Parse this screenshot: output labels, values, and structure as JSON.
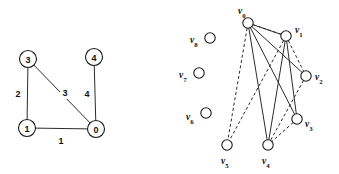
{
  "figure": {
    "width": 339,
    "height": 174,
    "background": "#ffffff",
    "stroke_color": "#2b2b2b",
    "node_fill": "#ffffff"
  },
  "left_graph": {
    "name": "weighted-undirected-graph",
    "nodes": [
      {
        "id": "3",
        "label": "3",
        "cx": 28,
        "cy": 59,
        "r": 8.5
      },
      {
        "id": "4",
        "label": "4",
        "cx": 94,
        "cy": 57,
        "r": 8.5
      },
      {
        "id": "1",
        "label": "1",
        "cx": 27,
        "cy": 128,
        "r": 8.5
      },
      {
        "id": "0",
        "label": "0",
        "cx": 96,
        "cy": 129,
        "r": 8.5
      }
    ],
    "edges": [
      {
        "from": "3",
        "to": "1",
        "weight": "2",
        "style": "solid",
        "label_x": 18,
        "label_y": 94
      },
      {
        "from": "3",
        "to": "0",
        "weight": "3",
        "style": "solid",
        "label_x": 65,
        "label_y": 93
      },
      {
        "from": "1",
        "to": "0",
        "weight": "1",
        "style": "solid",
        "label_x": 61,
        "label_y": 141
      },
      {
        "from": "4",
        "to": "0",
        "weight": "4",
        "style": "solid",
        "label_x": 87,
        "label_y": 94
      }
    ]
  },
  "right_graph": {
    "name": "vertex-labelled-graph",
    "nodes": [
      {
        "id": "v0",
        "base": "v",
        "sub": "0",
        "cx": 248,
        "cy": 23,
        "r": 5.2,
        "label_x": 238,
        "label_y": 11,
        "anchor": "start"
      },
      {
        "id": "v1",
        "base": "v",
        "sub": "1",
        "cx": 286,
        "cy": 36,
        "r": 5.2,
        "label_x": 295,
        "label_y": 30,
        "anchor": "start"
      },
      {
        "id": "v2",
        "base": "v",
        "sub": "2",
        "cx": 306,
        "cy": 76,
        "r": 5.2,
        "label_x": 315,
        "label_y": 77,
        "anchor": "start"
      },
      {
        "id": "v3",
        "base": "v",
        "sub": "3",
        "cx": 297,
        "cy": 119,
        "r": 5.2,
        "label_x": 305,
        "label_y": 124,
        "anchor": "start"
      },
      {
        "id": "v4",
        "base": "v",
        "sub": "4",
        "cx": 268,
        "cy": 145,
        "r": 5.2,
        "label_x": 262,
        "label_y": 161,
        "anchor": "start"
      },
      {
        "id": "v5",
        "base": "v",
        "sub": "5",
        "cx": 227,
        "cy": 145,
        "r": 5.2,
        "label_x": 221,
        "label_y": 161,
        "anchor": "start"
      },
      {
        "id": "v6",
        "base": "v",
        "sub": "6",
        "cx": 206,
        "cy": 113,
        "r": 5.2,
        "label_x": 186,
        "label_y": 117,
        "anchor": "start"
      },
      {
        "id": "v7",
        "base": "v",
        "sub": "7",
        "cx": 199,
        "cy": 73,
        "r": 5.2,
        "label_x": 179,
        "label_y": 75,
        "anchor": "start"
      },
      {
        "id": "v8",
        "base": "v",
        "sub": "8",
        "cx": 210,
        "cy": 38,
        "r": 5.2,
        "label_x": 190,
        "label_y": 40,
        "anchor": "start"
      }
    ],
    "edges": [
      {
        "from": "v0",
        "to": "v1",
        "style": "solid"
      },
      {
        "from": "v0",
        "to": "v3",
        "style": "solid"
      },
      {
        "from": "v0",
        "to": "v4",
        "style": "solid"
      },
      {
        "from": "v0",
        "to": "v2",
        "style": "solid"
      },
      {
        "from": "v0",
        "to": "v5",
        "style": "dashed"
      },
      {
        "from": "v1",
        "to": "v3",
        "style": "solid"
      },
      {
        "from": "v1",
        "to": "v4",
        "style": "solid"
      },
      {
        "from": "v1",
        "to": "v2",
        "style": "dashed"
      },
      {
        "from": "v1",
        "to": "v5",
        "style": "dashed"
      },
      {
        "from": "v2",
        "to": "v4",
        "style": "dashed"
      },
      {
        "from": "v3",
        "to": "v4",
        "style": "dashed"
      },
      {
        "from": "v1",
        "to": "v0",
        "style": "dashed-alt"
      }
    ],
    "isolated_nodes": [
      "v6",
      "v7",
      "v8"
    ]
  }
}
